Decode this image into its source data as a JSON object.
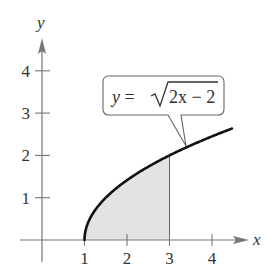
{
  "chart_data": {
    "type": "area",
    "function": "y = sqrt(2x - 2)",
    "annotation": {
      "label_prefix": "y = ",
      "radicand": "2x − 2"
    },
    "xlabel": "x",
    "ylabel": "y",
    "x_ticks": [
      "1",
      "2",
      "3",
      "4"
    ],
    "y_ticks": [
      "1",
      "2",
      "3",
      "4"
    ],
    "xlim": [
      0,
      5
    ],
    "ylim": [
      0,
      5
    ],
    "shaded_region": {
      "x_from": 1,
      "x_to": 3,
      "under": "curve",
      "above": "x-axis"
    },
    "curve_domain": [
      1,
      4.47
    ],
    "grid": false,
    "colors": {
      "curve": "#111111",
      "shade": "#e3e3e3",
      "axis": "#777777",
      "callout_border": "#666666"
    }
  }
}
